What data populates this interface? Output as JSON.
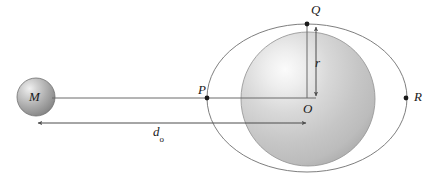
{
  "figure": {
    "type": "physics-diagram",
    "canvas": {
      "width": 439,
      "height": 181,
      "background": "#ffffff"
    },
    "labels": {
      "mass_point": "M",
      "point_near_surface": "P",
      "point_top": "Q",
      "point_far_surface": "R",
      "center": "O",
      "radius": "r",
      "distance_symbol": "d",
      "distance_subscript": "o"
    },
    "colors": {
      "stroke": "#4d4d4d",
      "sphere_edge": "#8f8f8f",
      "sphere_fill_light": "#f2f2f2",
      "sphere_fill_mid": "#c9c9c9",
      "sphere_fill_dark": "#a8a8a8",
      "small_sphere_light": "#e8e8e8",
      "small_sphere_dark": "#7a7a7a",
      "ellipse_stroke": "#707070",
      "text": "#1a1a1a",
      "dot": "#1a1a1a"
    },
    "geometry": {
      "small_sphere": {
        "cx": 36,
        "cy": 97,
        "r": 19
      },
      "big_sphere": {
        "cx": 308,
        "cy": 99,
        "r": 67
      },
      "outer_ellipse": {
        "cx": 307,
        "cy": 98,
        "rx": 100,
        "ry": 74
      },
      "point_P": {
        "x": 207,
        "y": 98
      },
      "point_Q": {
        "x": 307,
        "y": 24
      },
      "point_R": {
        "x": 406,
        "y": 98
      },
      "point_O": {
        "x": 308,
        "y": 99
      },
      "radius_arrow": {
        "x": 316,
        "y1": 26,
        "y2": 97
      },
      "distance_arrow": {
        "y": 123,
        "x1": 37,
        "x2": 307
      },
      "mass_line": {
        "y": 98,
        "x1": 52,
        "x2": 316
      }
    },
    "annotations": [
      {
        "name": "radius-measure",
        "text": "r",
        "description": "radius of sphere from Q down to center O"
      },
      {
        "name": "distance-measure",
        "text": "d_o",
        "description": "distance from mass M to center O of sphere"
      }
    ]
  }
}
